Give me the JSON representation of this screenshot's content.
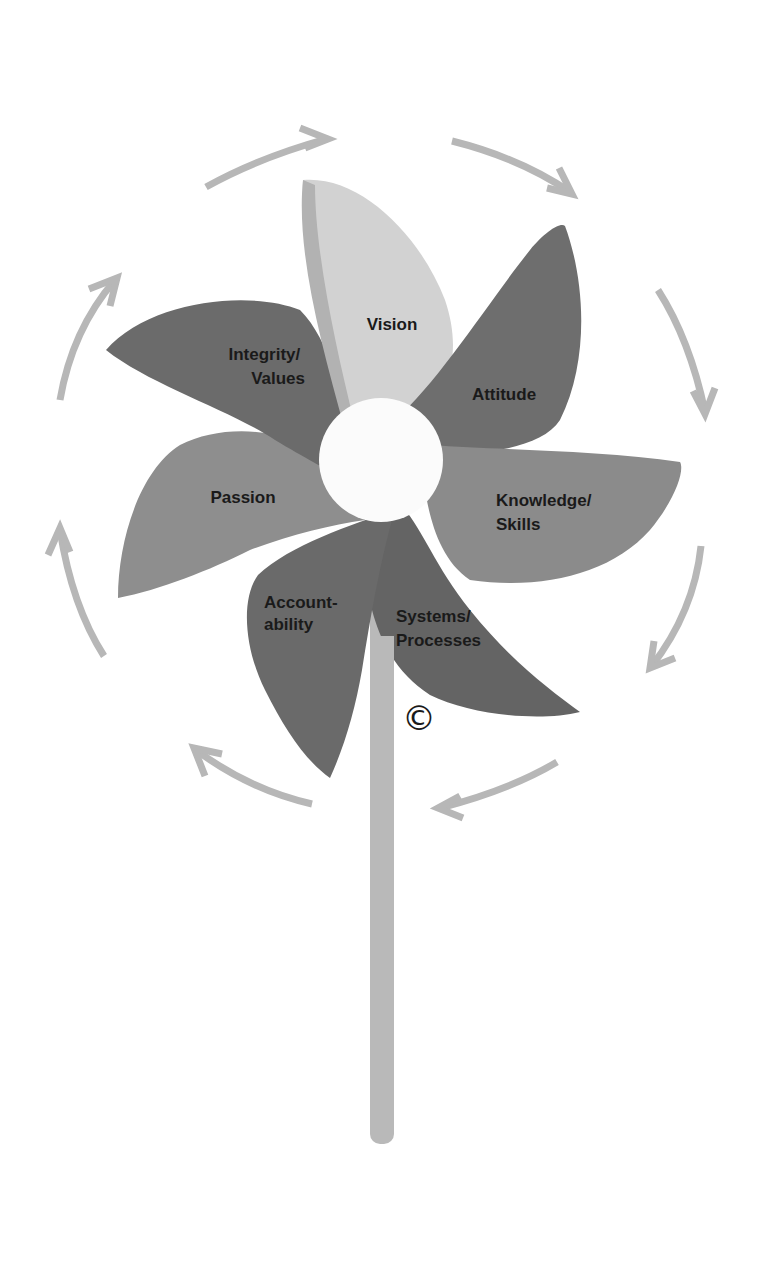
{
  "diagram": {
    "type": "pinwheel",
    "colors": {
      "background": "#ffffff",
      "light_blade": "#d2d2d2",
      "light_blade_shadow": "#b4b4b4",
      "mid_blade": "#8c8c8c",
      "dark_blade": "#6a6a6a",
      "hub": "#fbfbfb",
      "stick": "#b9b9b9",
      "arrows": "#b7b7b7",
      "text": "#1a1a1a"
    },
    "blades": [
      {
        "id": "vision",
        "lines": [
          "Vision"
        ]
      },
      {
        "id": "attitude",
        "lines": [
          "Attitude"
        ]
      },
      {
        "id": "knowledge-skills",
        "lines": [
          "Knowledge/",
          "Skills"
        ]
      },
      {
        "id": "systems-processes",
        "lines": [
          "Systems/",
          "Processes"
        ]
      },
      {
        "id": "accountability",
        "lines": [
          "Account-",
          "ability"
        ]
      },
      {
        "id": "passion",
        "lines": [
          "Passion"
        ]
      },
      {
        "id": "integrity-values",
        "lines": [
          "Integrity/",
          "Values"
        ]
      }
    ],
    "copyright_symbol": "©",
    "rotation_arrows": {
      "count": 8,
      "direction": "clockwise"
    }
  }
}
